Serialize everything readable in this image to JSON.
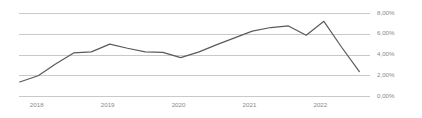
{
  "chart_data": {
    "type": "line",
    "title": "",
    "subtitle": "",
    "xlabel": "",
    "ylabel": "",
    "grid": true,
    "legend": false,
    "legend_position": "none",
    "decimal_separator": ",",
    "value_suffix": "%",
    "xlim": [
      2017.75,
      2022.7
    ],
    "ylim": [
      0,
      8
    ],
    "y_ticks": [
      0,
      2,
      4,
      6,
      8
    ],
    "y_tick_labels": [
      "0,00%",
      "2,00%",
      "4,00%",
      "6,00%",
      "8,00%"
    ],
    "x_ticks": [
      2018,
      2019,
      2020,
      2021,
      2022
    ],
    "x_tick_labels": [
      "2018",
      "2019",
      "2020",
      "2021",
      "2022"
    ],
    "series": [
      {
        "name": "Rate",
        "color": "#5a5a5a",
        "x": [
          2017.76,
          2018.02,
          2018.26,
          2018.52,
          2018.77,
          2019.03,
          2019.28,
          2019.53,
          2019.78,
          2020.03,
          2020.29,
          2020.54,
          2020.79,
          2021.04,
          2021.3,
          2021.55,
          2021.8,
          2022.05,
          2022.3,
          2022.55
        ],
        "values": [
          1.35,
          1.95,
          3.05,
          4.15,
          4.25,
          5.0,
          4.6,
          4.25,
          4.2,
          3.7,
          4.25,
          4.95,
          5.6,
          6.25,
          6.6,
          6.75,
          5.85,
          7.2,
          4.7,
          2.35
        ],
        "axis_colors": {
          "grid": "#c9c9c9",
          "tick_label": "#8a8a8a",
          "line": "#5a5a5a"
        }
      }
    ]
  },
  "layout": {
    "plot_left": 19,
    "plot_right": 370,
    "plot_top": 13,
    "plot_bottom": 96,
    "y_label_x": 377,
    "x_label_y": 107
  }
}
